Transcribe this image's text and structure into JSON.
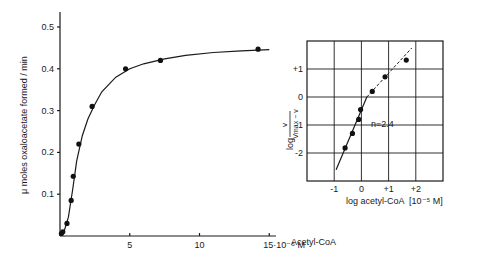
{
  "chart_data": [
    {
      "type": "scatter",
      "title": "",
      "xlabel": "Acetyl-CoA",
      "x_unit_label": "15·10⁻⁵ M",
      "ylabel": "μ moles oxaloacetate formed / min",
      "xlim": [
        0,
        15.5
      ],
      "ylim": [
        0,
        0.53
      ],
      "x_ticks": [
        5,
        10,
        15
      ],
      "x_tick_labels": [
        "5",
        "10",
        "15·10⁻⁵ M"
      ],
      "y_ticks": [
        0.1,
        0.2,
        0.3,
        0.4,
        0.5
      ],
      "y_tick_labels": [
        "0.1",
        "0.2",
        "0.3",
        "0.4",
        "0.5"
      ],
      "grid": false,
      "series": [
        {
          "name": "measured",
          "marker": "filled-circle",
          "x": [
            0.1,
            0.2,
            0.5,
            0.8,
            0.95,
            1.35,
            2.3,
            4.7,
            7.2,
            14.2
          ],
          "y": [
            0.006,
            0.01,
            0.03,
            0.085,
            0.143,
            0.22,
            0.31,
            0.4,
            0.42,
            0.447
          ]
        },
        {
          "name": "fitted sigmoid curve",
          "marker": "none",
          "line": "solid",
          "x": [
            0,
            0.3,
            0.6,
            0.9,
            1.2,
            1.6,
            2.0,
            2.5,
            3.0,
            4.0,
            5.0,
            6.0,
            7.5,
            9.0,
            11.0,
            13.0,
            15.0
          ],
          "y": [
            0.0,
            0.012,
            0.045,
            0.11,
            0.18,
            0.24,
            0.28,
            0.315,
            0.345,
            0.38,
            0.4,
            0.412,
            0.424,
            0.432,
            0.439,
            0.443,
            0.446
          ]
        }
      ]
    },
    {
      "type": "scatter",
      "title": "Hill plot",
      "xlabel": "log acetyl-CoA  [10⁻⁵ M]",
      "ylabel": "log v / (Vmax − v)",
      "ylabel_parts": {
        "prefix": "log",
        "numerator": "v",
        "denominator": "Vmax − v"
      },
      "xlim": [
        -2,
        3
      ],
      "ylim": [
        -3,
        2
      ],
      "x_ticks": [
        -1,
        0,
        1,
        2
      ],
      "x_tick_labels": [
        "-1",
        "0",
        "+1",
        "+2"
      ],
      "y_ticks": [
        1,
        0,
        -1,
        -2
      ],
      "y_tick_labels": [
        "+1",
        "0",
        "-1",
        "-2"
      ],
      "grid": true,
      "annotations": [
        {
          "text": "n=2.4",
          "x": 0.35,
          "y": -0.95
        }
      ],
      "series": [
        {
          "name": "measured",
          "marker": "filled-circle",
          "x": [
            -0.6,
            -0.33,
            -0.1,
            -0.03,
            0.4,
            0.87,
            1.65
          ],
          "y": [
            -1.82,
            -1.3,
            -0.8,
            -0.45,
            0.2,
            0.72,
            1.32
          ]
        },
        {
          "name": "fit n=2.4",
          "line": "solid",
          "x": [
            -0.93,
            0.2
          ],
          "y": [
            -2.6,
            0.0
          ]
        },
        {
          "name": "upper extrapolation",
          "line": "dashed",
          "x": [
            0.2,
            1.85
          ],
          "y": [
            0.0,
            1.75
          ]
        }
      ]
    }
  ]
}
